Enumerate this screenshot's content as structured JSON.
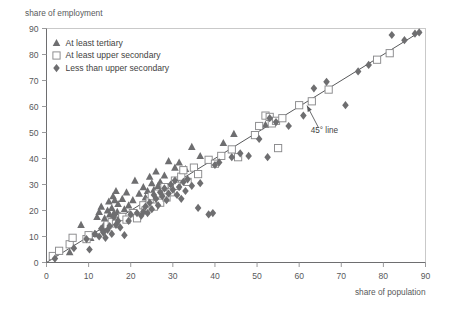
{
  "chart_data": {
    "type": "scatter",
    "title": "",
    "xlabel": "share of population",
    "ylabel": "share of employment",
    "xlim": [
      0,
      90
    ],
    "ylim": [
      0,
      90
    ],
    "xticks": [
      0,
      10,
      20,
      30,
      40,
      50,
      60,
      70,
      80,
      90
    ],
    "yticks": [
      0,
      10,
      20,
      30,
      40,
      50,
      60,
      70,
      80,
      90
    ],
    "grid": false,
    "legend_position": "top-left",
    "annotations": [
      {
        "text": "45° line",
        "x": 66,
        "y": 50,
        "points_to_x": 61.5,
        "points_to_y": 61.5
      }
    ],
    "reference_line": {
      "name": "45° line",
      "from": [
        0,
        0
      ],
      "to": [
        89,
        89
      ]
    },
    "series": [
      {
        "name": "At least tertiary",
        "marker": "triangle",
        "color": "#6e6e70",
        "points": [
          [
            5.5,
            4.0
          ],
          [
            8.2,
            14.5
          ],
          [
            10.5,
            9.5
          ],
          [
            11.5,
            11.0
          ],
          [
            12.0,
            17.5
          ],
          [
            12.5,
            19.5
          ],
          [
            13.0,
            21.5
          ],
          [
            13.5,
            14.0
          ],
          [
            13.8,
            17.0
          ],
          [
            14.0,
            13.0
          ],
          [
            14.5,
            20.0
          ],
          [
            14.8,
            23.5
          ],
          [
            15.0,
            18.5
          ],
          [
            15.2,
            16.0
          ],
          [
            15.5,
            21.0
          ],
          [
            15.8,
            25.5
          ],
          [
            16.0,
            19.0
          ],
          [
            16.2,
            24.0
          ],
          [
            16.5,
            27.5
          ],
          [
            16.8,
            19.5
          ],
          [
            17.0,
            22.5
          ],
          [
            17.5,
            18.0
          ],
          [
            18.0,
            24.5
          ],
          [
            18.5,
            20.5
          ],
          [
            19.0,
            27.0
          ],
          [
            19.5,
            22.0
          ],
          [
            20.5,
            24.0
          ],
          [
            21.0,
            31.5
          ],
          [
            22.0,
            26.5
          ],
          [
            23.0,
            29.0
          ],
          [
            23.5,
            25.0
          ],
          [
            24.0,
            27.5
          ],
          [
            24.5,
            33.0
          ],
          [
            25.0,
            30.5
          ],
          [
            25.5,
            28.0
          ],
          [
            26.0,
            35.0
          ],
          [
            26.5,
            29.5
          ],
          [
            27.0,
            31.0
          ],
          [
            28.0,
            33.5
          ],
          [
            29.0,
            39.0
          ],
          [
            30.5,
            36.5
          ],
          [
            31.5,
            38.5
          ],
          [
            33.0,
            36.0
          ],
          [
            34.5,
            44.5
          ],
          [
            36.5,
            41.0
          ],
          [
            42.0,
            46.0
          ],
          [
            44.5,
            49.5
          ],
          [
            52.0,
            53.0
          ]
        ]
      },
      {
        "name": "At least upper secondary",
        "marker": "square",
        "color": "#ffffff",
        "edge": "#8a8a8c",
        "points": [
          [
            1.5,
            2.5
          ],
          [
            3.0,
            4.5
          ],
          [
            5.5,
            7.0
          ],
          [
            6.2,
            9.5
          ],
          [
            9.5,
            9.0
          ],
          [
            10.0,
            10.5
          ],
          [
            14.5,
            14.5
          ],
          [
            15.5,
            15.5
          ],
          [
            16.5,
            15.0
          ],
          [
            18.0,
            17.5
          ],
          [
            19.0,
            16.5
          ],
          [
            20.5,
            19.0
          ],
          [
            21.5,
            17.0
          ],
          [
            23.0,
            22.0
          ],
          [
            23.5,
            20.0
          ],
          [
            24.5,
            23.5
          ],
          [
            25.0,
            25.5
          ],
          [
            25.5,
            21.5
          ],
          [
            26.5,
            26.5
          ],
          [
            27.0,
            23.0
          ],
          [
            28.0,
            29.0
          ],
          [
            28.5,
            25.0
          ],
          [
            29.5,
            27.0
          ],
          [
            30.5,
            31.5
          ],
          [
            31.0,
            29.5
          ],
          [
            32.0,
            33.0
          ],
          [
            32.5,
            35.5
          ],
          [
            33.5,
            31.0
          ],
          [
            35.0,
            36.5
          ],
          [
            36.0,
            34.0
          ],
          [
            38.5,
            39.5
          ],
          [
            40.0,
            38.0
          ],
          [
            41.5,
            41.0
          ],
          [
            44.0,
            43.5
          ],
          [
            45.5,
            40.5
          ],
          [
            49.5,
            49.0
          ],
          [
            50.5,
            52.5
          ],
          [
            52.0,
            56.5
          ],
          [
            53.0,
            56.0
          ],
          [
            53.5,
            53.5
          ],
          [
            54.5,
            54.5
          ],
          [
            55.0,
            44.0
          ],
          [
            56.0,
            55.5
          ],
          [
            60.0,
            60.5
          ],
          [
            63.0,
            62.0
          ],
          [
            67.0,
            66.5
          ],
          [
            78.5,
            78.0
          ],
          [
            81.5,
            80.5
          ]
        ]
      },
      {
        "name": "Less than upper secondary",
        "marker": "diamond",
        "color": "#6e6e70",
        "points": [
          [
            2.0,
            1.5
          ],
          [
            6.5,
            5.5
          ],
          [
            9.5,
            9.0
          ],
          [
            10.2,
            5.0
          ],
          [
            11.5,
            11.0
          ],
          [
            12.5,
            10.0
          ],
          [
            13.0,
            13.0
          ],
          [
            13.5,
            11.5
          ],
          [
            14.0,
            9.5
          ],
          [
            14.5,
            12.5
          ],
          [
            15.0,
            14.0
          ],
          [
            15.5,
            11.0
          ],
          [
            16.0,
            17.5
          ],
          [
            16.5,
            14.5
          ],
          [
            17.0,
            16.0
          ],
          [
            17.5,
            13.5
          ],
          [
            18.5,
            10.5
          ],
          [
            19.5,
            16.0
          ],
          [
            20.0,
            18.5
          ],
          [
            21.5,
            19.0
          ],
          [
            22.5,
            18.0
          ],
          [
            23.0,
            19.5
          ],
          [
            23.5,
            21.5
          ],
          [
            24.0,
            19.0
          ],
          [
            24.5,
            23.0
          ],
          [
            25.0,
            20.5
          ],
          [
            25.5,
            26.0
          ],
          [
            26.0,
            24.5
          ],
          [
            26.5,
            22.0
          ],
          [
            27.0,
            27.0
          ],
          [
            27.5,
            25.5
          ],
          [
            28.0,
            28.5
          ],
          [
            28.5,
            24.0
          ],
          [
            29.0,
            26.5
          ],
          [
            29.5,
            30.0
          ],
          [
            30.0,
            28.0
          ],
          [
            30.5,
            31.5
          ],
          [
            31.0,
            26.0
          ],
          [
            31.5,
            29.0
          ],
          [
            32.0,
            24.5
          ],
          [
            32.5,
            31.0
          ],
          [
            33.0,
            27.5
          ],
          [
            33.5,
            32.0
          ],
          [
            34.5,
            29.5
          ],
          [
            36.0,
            21.0
          ],
          [
            36.5,
            30.5
          ],
          [
            38.5,
            18.5
          ],
          [
            39.5,
            19.0
          ],
          [
            40.0,
            37.5
          ],
          [
            41.0,
            38.5
          ],
          [
            44.0,
            40.5
          ],
          [
            46.0,
            42.0
          ],
          [
            48.0,
            41.0
          ],
          [
            50.5,
            47.5
          ],
          [
            52.5,
            40.5
          ],
          [
            53.0,
            55.5
          ],
          [
            54.5,
            54.0
          ],
          [
            57.5,
            52.5
          ],
          [
            61.0,
            56.5
          ],
          [
            63.5,
            67.0
          ],
          [
            66.5,
            69.5
          ],
          [
            71.0,
            60.5
          ],
          [
            74.0,
            73.5
          ],
          [
            76.5,
            76.0
          ],
          [
            82.0,
            87.5
          ],
          [
            85.0,
            85.5
          ],
          [
            87.5,
            88.0
          ],
          [
            88.5,
            88.5
          ]
        ]
      }
    ]
  },
  "legend": {
    "items": [
      {
        "label": "At least tertiary",
        "marker": "triangle"
      },
      {
        "label": "At least upper secondary",
        "marker": "square"
      },
      {
        "label": "Less than upper secondary",
        "marker": "diamond"
      }
    ]
  },
  "colors": {
    "marker_gray": "#6e6e70",
    "square_edge": "#8a8a8c",
    "axis": "#6e6e70",
    "frame": "#c9c9c9",
    "text": "#58595b"
  }
}
